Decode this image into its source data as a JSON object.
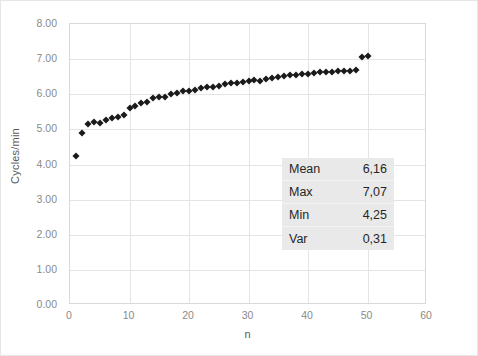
{
  "chart_data": {
    "type": "scatter",
    "title": "",
    "xlabel": "n",
    "ylabel": "Cycles/min",
    "xlim": [
      0,
      60
    ],
    "ylim": [
      0,
      8
    ],
    "grid": true,
    "legend": "none",
    "marker": "diamond",
    "marker_color": "#1a1a1a",
    "xticks": [
      "0",
      "10",
      "20",
      "30",
      "40",
      "50",
      "60"
    ],
    "xtick_values": [
      0,
      10,
      20,
      30,
      40,
      50,
      60
    ],
    "yticks": [
      "0.00",
      "1.00",
      "2.00",
      "3.00",
      "4.00",
      "5.00",
      "6.00",
      "7.00",
      "8.00"
    ],
    "ytick_values": [
      0,
      1,
      2,
      3,
      4,
      5,
      6,
      7,
      8
    ],
    "x": [
      1,
      2,
      3,
      4,
      5,
      6,
      7,
      8,
      9,
      10,
      11,
      12,
      13,
      14,
      15,
      16,
      17,
      18,
      19,
      20,
      21,
      22,
      23,
      24,
      25,
      26,
      27,
      28,
      29,
      30,
      31,
      32,
      33,
      34,
      35,
      36,
      37,
      38,
      39,
      40,
      41,
      42,
      43,
      44,
      45,
      46,
      47,
      48,
      49,
      50
    ],
    "values": [
      4.25,
      4.9,
      5.16,
      5.2,
      5.19,
      5.27,
      5.33,
      5.36,
      5.42,
      5.62,
      5.66,
      5.74,
      5.78,
      5.88,
      5.93,
      5.92,
      6.0,
      6.04,
      6.08,
      6.1,
      6.13,
      6.17,
      6.2,
      6.2,
      6.23,
      6.28,
      6.31,
      6.33,
      6.35,
      6.38,
      6.4,
      6.39,
      6.42,
      6.47,
      6.5,
      6.51,
      6.54,
      6.55,
      6.57,
      6.57,
      6.6,
      6.62,
      6.63,
      6.64,
      6.66,
      6.67,
      6.67,
      6.7,
      7.07,
      7.1
    ]
  },
  "axes": {
    "y_title": "Cycles/min",
    "x_title": "n"
  },
  "stats": {
    "rows": [
      {
        "label": "Mean",
        "value": "6,16"
      },
      {
        "label": "Max",
        "value": "7,07"
      },
      {
        "label": "Min",
        "value": "4,25"
      },
      {
        "label": "Var",
        "value": "0,31"
      }
    ]
  }
}
